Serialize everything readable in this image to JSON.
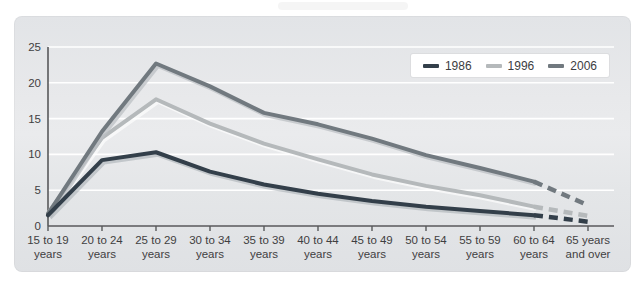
{
  "page": {
    "background_color": "#ffffff",
    "card_background_color": "#e4e6e8"
  },
  "chart_data": {
    "type": "line",
    "title": "",
    "xlabel": "",
    "ylabel": "",
    "ylim": [
      0,
      25
    ],
    "yticks": [
      0,
      5,
      10,
      15,
      20,
      25
    ],
    "grid": "horizontal-white-gridlines",
    "legend_position": "top-right",
    "dashed_last_segment": true,
    "categories": [
      {
        "top": "15 to 19",
        "bottom": "years"
      },
      {
        "top": "20 to 24",
        "bottom": "years"
      },
      {
        "top": "25 to 29",
        "bottom": "years"
      },
      {
        "top": "30 to 34",
        "bottom": "years"
      },
      {
        "top": "35 to 39",
        "bottom": "years"
      },
      {
        "top": "40 to 44",
        "bottom": "years"
      },
      {
        "top": "45 to 49",
        "bottom": "years"
      },
      {
        "top": "50 to 54",
        "bottom": "years"
      },
      {
        "top": "55 to 59",
        "bottom": "years"
      },
      {
        "top": "60 to 64",
        "bottom": "years"
      },
      {
        "top": "65 years",
        "bottom": "and over"
      }
    ],
    "series": [
      {
        "name": "1996",
        "color": "#b5b9bb",
        "echo": "rgba(255,255,255,0.65)",
        "values": [
          1.8,
          12.3,
          17.7,
          14.3,
          11.5,
          9.3,
          7.2,
          5.6,
          4.3,
          2.7,
          1.4
        ]
      },
      {
        "name": "2006",
        "color": "#71797f",
        "echo": "rgba(188,192,196,0.75)",
        "values": [
          1.7,
          13.2,
          22.7,
          19.5,
          15.8,
          14.2,
          12.2,
          9.9,
          8.1,
          6.2,
          2.9
        ]
      },
      {
        "name": "1986",
        "color": "#333f4a",
        "echo": "rgba(170,176,182,0.6)",
        "values": [
          1.5,
          9.2,
          10.3,
          7.6,
          5.8,
          4.5,
          3.5,
          2.7,
          2.1,
          1.5,
          0.6
        ]
      }
    ],
    "legend_order": [
      "1986",
      "1996",
      "2006"
    ]
  },
  "style": {
    "gridline_color": "#ffffff",
    "axis_color": "#58595b",
    "tick_label_color": "#3f4041"
  }
}
